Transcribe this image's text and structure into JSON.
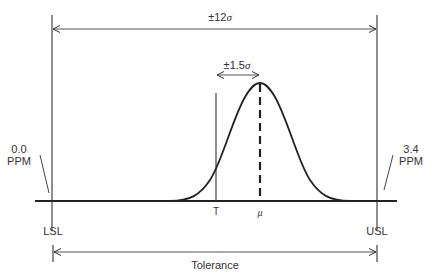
{
  "diagram": {
    "top_span_label": {
      "prefix": "±12",
      "symbol": "σ"
    },
    "shift_label": {
      "prefix": "±1.5",
      "symbol": "σ"
    },
    "left_ppm": {
      "value": "0.0",
      "unit": "PPM"
    },
    "right_ppm": {
      "value": "3.4",
      "unit": "PPM"
    },
    "target_label": "T",
    "mean_label": "μ",
    "lsl_label": "LSL",
    "usl_label": "USL",
    "tolerance_label": "Tolerance",
    "colors": {
      "line": "#333333",
      "background": "#ffffff"
    }
  }
}
